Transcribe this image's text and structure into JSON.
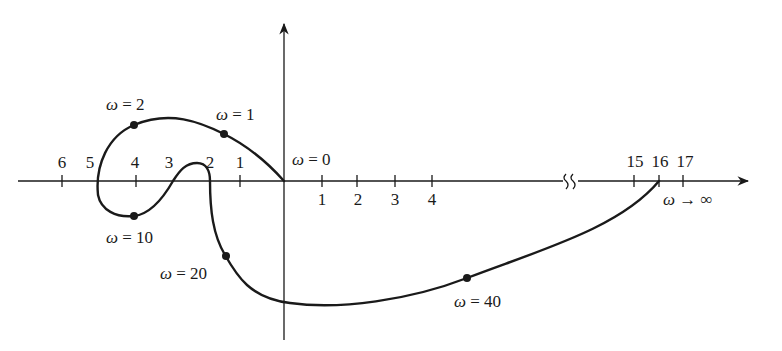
{
  "diagram": {
    "type": "nyquist-plot",
    "colors": {
      "ink": "#1a1a1a",
      "background": "#ffffff"
    },
    "negative_axis_ticks": [
      {
        "label": "1",
        "x": 240
      },
      {
        "label": "2",
        "x": 210
      },
      {
        "label": "3",
        "x": 173
      },
      {
        "label": "4",
        "x": 136
      },
      {
        "label": "5",
        "x": 98
      },
      {
        "label": "6",
        "x": 62
      }
    ],
    "positive_axis_ticks": [
      {
        "label": "1",
        "x": 322
      },
      {
        "label": "2",
        "x": 357
      },
      {
        "label": "3",
        "x": 395
      },
      {
        "label": "4",
        "x": 432
      }
    ],
    "far_axis_ticks": [
      {
        "label": "15",
        "x": 634
      },
      {
        "label": "16",
        "x": 659
      },
      {
        "label": "17",
        "x": 683
      }
    ],
    "points": [
      {
        "omega_label": "ω",
        "eq": " = 0",
        "name": "omega-0"
      },
      {
        "omega_label": "ω",
        "eq": " = 1",
        "name": "omega-1"
      },
      {
        "omega_label": "ω",
        "eq": " = 2",
        "name": "omega-2"
      },
      {
        "omega_label": "ω",
        "eq": " = 10",
        "name": "omega-10"
      },
      {
        "omega_label": "ω",
        "eq": " = 20",
        "name": "omega-20"
      },
      {
        "omega_label": "ω",
        "eq": " = 40",
        "name": "omega-40"
      },
      {
        "omega_label": "ω",
        "eq": " → ∞",
        "name": "omega-infinity"
      }
    ],
    "labels": {
      "neg": [
        "1",
        "2",
        "3",
        "4",
        "5",
        "6"
      ],
      "pos": [
        "1",
        "2",
        "3",
        "4"
      ],
      "far": [
        "15",
        "16",
        "17"
      ],
      "omega_symbol": "ω",
      "w0": " = 0",
      "w1": " = 1",
      "w2": " = 2",
      "w10": " = 10",
      "w20": " = 20",
      "w40": " = 40",
      "winf": " → ∞"
    }
  }
}
